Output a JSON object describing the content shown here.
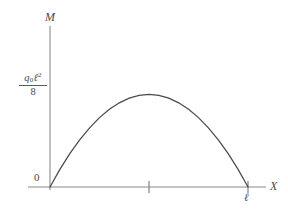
{
  "figure": {
    "background_color": "#ffffff",
    "axis_color": "#8a8a8a",
    "curve_color": "#4a4a4a",
    "text_color": "#4a4a4a"
  },
  "axes": {
    "y_axis_label": "M",
    "x_axis_label": "X",
    "origin_label": "0"
  },
  "ticks": {
    "x": [
      {
        "label": "",
        "value": 0.5
      },
      {
        "label": "ℓ",
        "value": 1.0
      }
    ],
    "y": [
      {
        "label_numerator_main": "q",
        "label_numerator_sub": "0",
        "label_numerator_var": "ℓ",
        "label_numerator_sup": "2",
        "label_denominator": "8",
        "value": 1.0
      }
    ]
  },
  "chart_data": {
    "type": "line",
    "title": "",
    "subtitle": "",
    "xlabel": "X",
    "ylabel": "M",
    "grid": false,
    "legend": null,
    "annotations": [
      {
        "text": "0",
        "x": 0.0,
        "y": 0.0
      },
      {
        "text": "q₀ℓ²/8",
        "x": 0.0,
        "y": 1.0
      }
    ],
    "xlim": [
      0,
      1.13
    ],
    "ylim": [
      0,
      1.22
    ],
    "xticks": [
      0.5,
      1.0
    ],
    "xticklabels": [
      "",
      "ℓ"
    ],
    "yticks": [
      1.0
    ],
    "yticklabels": [
      "q₀ℓ²/8"
    ],
    "series": [
      {
        "name": "Bending moment M(x)",
        "description": "Parabolic bending moment diagram for simply supported beam under uniform load q0, M = q0*x*(l-x)/2, peak q0*l^2/8 at midspan",
        "x": [
          0.0,
          0.05,
          0.1,
          0.15,
          0.2,
          0.25,
          0.3,
          0.35,
          0.4,
          0.45,
          0.5,
          0.55,
          0.6,
          0.65,
          0.7,
          0.75,
          0.8,
          0.85,
          0.9,
          0.95,
          1.0
        ],
        "y": [
          0.0,
          0.19,
          0.36,
          0.51,
          0.64,
          0.75,
          0.84,
          0.91,
          0.96,
          0.99,
          1.0,
          0.99,
          0.96,
          0.91,
          0.84,
          0.75,
          0.64,
          0.51,
          0.36,
          0.19,
          0.0
        ]
      }
    ]
  }
}
